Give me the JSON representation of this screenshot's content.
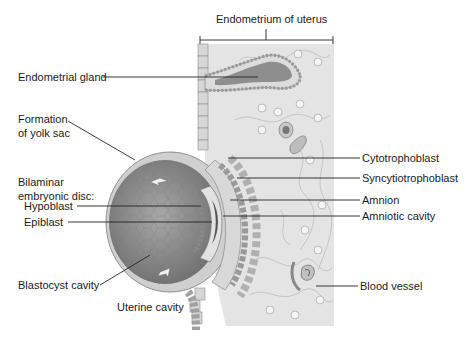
{
  "figure": {
    "title_label": "Endometrium of uterus",
    "labels": {
      "endometrial_gland": "Endometrial gland",
      "formation_line1": "Formation",
      "formation_line2": "of yolk sac",
      "bilaminar_line1": "Bilaminar",
      "bilaminar_line2": "embryonic disc:",
      "hypoblast": "Hypoblast",
      "epiblast": "Epiblast",
      "blastocyst_cavity": "Blastocyst cavity",
      "uterine_cavity": "Uterine cavity",
      "cytotrophoblast": "Cytotrophoblast",
      "syncytiotrophoblast": "Syncytiotrophoblast",
      "amnion": "Amnion",
      "amniotic_cavity": "Amniotic cavity",
      "blood_vessel": "Blood vessel"
    }
  },
  "colors": {
    "tissue_bg": "#e6e6e6",
    "blastocyst_fill": "#8e8e8e",
    "gland_lumen": "#8a8a8a",
    "line": "#222222"
  }
}
